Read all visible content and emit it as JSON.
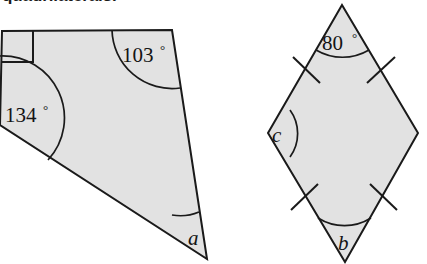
{
  "heading": {
    "text": "quadrilaterals."
  },
  "figures": {
    "left": {
      "name": "irregular-quadrilateral",
      "fill_color": "#e2e2e2",
      "stroke_color": "#1a1a1a",
      "angles": {
        "top_left": {
          "label": "",
          "marker": "right-angle-square",
          "value": "90"
        },
        "top_right": {
          "label": "103",
          "degree": "°",
          "value": "103"
        },
        "left": {
          "label": "134",
          "degree": "°",
          "value": "134"
        },
        "bottom": {
          "label": "a",
          "degree": "",
          "value": "unknown"
        }
      }
    },
    "right": {
      "name": "rhombus-kite",
      "fill_color": "#e2e2e2",
      "stroke_color": "#1a1a1a",
      "tick_marks": 4,
      "angles": {
        "top": {
          "label": "80",
          "degree": "°",
          "value": "80"
        },
        "left": {
          "label": "c",
          "degree": "",
          "value": "unknown"
        },
        "bottom": {
          "label": "b",
          "degree": "",
          "value": "unknown"
        },
        "right": {
          "label": "",
          "degree": "",
          "value": "unmarked"
        }
      }
    }
  }
}
